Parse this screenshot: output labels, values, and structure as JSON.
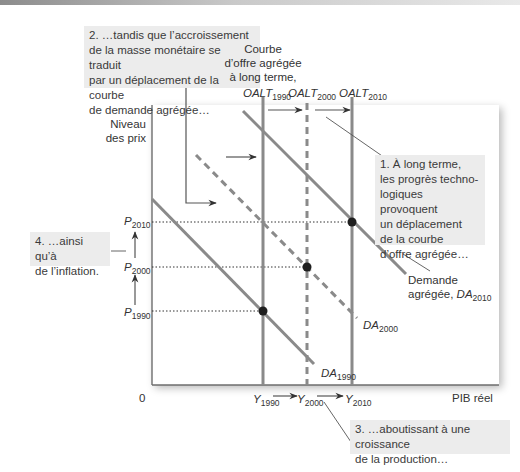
{
  "figure": {
    "type": "AS-AD diagram (long-run growth with inflation)",
    "colors": {
      "curve": "#8a8a8a",
      "axis": "#6e6e6e",
      "dot": "#1f1f1f",
      "callout_bg": "#ececec",
      "text": "#3a3a3a"
    }
  },
  "axes": {
    "y_label_line1": "Niveau",
    "y_label_line2": "des prix",
    "x_label": "PIB réel",
    "origin": "0"
  },
  "supply": {
    "heading_line1": "Courbe",
    "heading_line2": "d’offre agrégée",
    "heading_line3": "à long terme,",
    "curves": [
      {
        "base": "OALT",
        "sub": "1990",
        "style": "solid"
      },
      {
        "base": "OALT",
        "sub": "2000",
        "style": "dashed"
      },
      {
        "base": "OALT",
        "sub": "2010",
        "style": "solid"
      }
    ]
  },
  "demand": {
    "curves": [
      {
        "base": "DA",
        "sub": "1990",
        "style": "solid"
      },
      {
        "base": "DA",
        "sub": "2000",
        "style": "dashed"
      },
      {
        "prefix_line1": "Demande",
        "prefix_line2": "agrégée, ",
        "base": "DA",
        "sub": "2010",
        "style": "solid"
      }
    ]
  },
  "price_levels": [
    {
      "base": "P",
      "sub": "2010"
    },
    {
      "base": "P",
      "sub": "2000"
    },
    {
      "base": "P",
      "sub": "1990"
    }
  ],
  "output_levels": [
    {
      "base": "Y",
      "sub": "1990"
    },
    {
      "base": "Y",
      "sub": "2000"
    },
    {
      "base": "Y",
      "sub": "2010"
    }
  ],
  "callouts": {
    "c1": [
      "1. À long terme,",
      "les progrès techno-",
      "logiques provoquent",
      "un déplacement",
      "de la courbe",
      "d’offre agrégée…"
    ],
    "c2": [
      "2. …tandis que l’accroissement",
      "de la masse monétaire se traduit",
      "par un déplacement de la courbe",
      "de demande agrégée…"
    ],
    "c3": [
      "3. …aboutissant à une croissance",
      "de la production…"
    ],
    "c4": [
      "4. …ainsi qu’à",
      "de l’inflation."
    ]
  }
}
